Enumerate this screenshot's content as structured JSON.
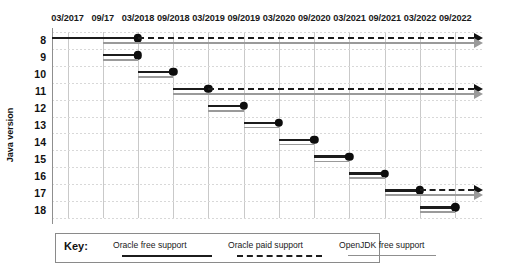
{
  "chart_data": {
    "type": "bar",
    "title": "",
    "subtitle": "",
    "xlabel": "",
    "ylabel": "Java version",
    "grid": true,
    "legend_position": "bottom",
    "x_ticks": [
      "03/2017",
      "09/17",
      "03/2018",
      "09/2018",
      "03/2019",
      "09/2019",
      "03/2020",
      "09/2020",
      "03/2021",
      "09/2021",
      "03/2022",
      "09/2022"
    ],
    "x_tick_values": [
      2017.17,
      2017.67,
      2018.17,
      2018.67,
      2019.17,
      2019.67,
      2020.17,
      2020.67,
      2021.17,
      2021.67,
      2022.17,
      2022.67
    ],
    "xlim": [
      2016.95,
      2023.05
    ],
    "categories": [
      "8",
      "9",
      "10",
      "11",
      "12",
      "13",
      "14",
      "15",
      "16",
      "17",
      "18"
    ],
    "ylim_categories": [
      "8",
      "9",
      "10",
      "11",
      "12",
      "13",
      "14",
      "15",
      "16",
      "17",
      "18"
    ],
    "series": [
      {
        "name": "Oracle free support",
        "style": "solid",
        "color": "#1c1c1c",
        "segments": [
          {
            "version": "8",
            "start": 2016.95,
            "end": 2018.17,
            "end_marker": "dot"
          },
          {
            "version": "9",
            "start": 2017.67,
            "end": 2018.17,
            "end_marker": "dot"
          },
          {
            "version": "10",
            "start": 2018.17,
            "end": 2018.67,
            "end_marker": "dot"
          },
          {
            "version": "11",
            "start": 2018.67,
            "end": 2019.17,
            "end_marker": "dot"
          },
          {
            "version": "12",
            "start": 2019.17,
            "end": 2019.67,
            "end_marker": "dot"
          },
          {
            "version": "13",
            "start": 2019.67,
            "end": 2020.17,
            "end_marker": "dot"
          },
          {
            "version": "14",
            "start": 2020.17,
            "end": 2020.67,
            "end_marker": "dot"
          },
          {
            "version": "15",
            "start": 2020.67,
            "end": 2021.17,
            "end_marker": "dot"
          },
          {
            "version": "16",
            "start": 2021.17,
            "end": 2021.67,
            "end_marker": "dot"
          },
          {
            "version": "17",
            "start": 2021.67,
            "end": 2022.17,
            "end_marker": "dot"
          },
          {
            "version": "18",
            "start": 2022.17,
            "end": 2022.67,
            "end_marker": "dot"
          }
        ]
      },
      {
        "name": "Oracle paid support",
        "style": "dashed",
        "color": "#1c1c1c",
        "segments": [
          {
            "version": "8",
            "start": 2018.17,
            "end": 2023.05,
            "end_marker": "arrow"
          },
          {
            "version": "11",
            "start": 2019.17,
            "end": 2023.05,
            "end_marker": "arrow"
          },
          {
            "version": "17",
            "start": 2022.17,
            "end": 2023.05,
            "end_marker": "arrow"
          }
        ]
      },
      {
        "name": "OpenJDK free support",
        "style": "solid",
        "color": "#9a9a9a",
        "segments": [
          {
            "version": "8",
            "start": 2017.67,
            "end": 2023.05,
            "end_marker": "arrow"
          },
          {
            "version": "9",
            "start": 2017.67,
            "end": 2018.17,
            "end_marker": "none"
          },
          {
            "version": "10",
            "start": 2018.17,
            "end": 2018.67,
            "end_marker": "none"
          },
          {
            "version": "11",
            "start": 2018.67,
            "end": 2023.05,
            "end_marker": "arrow"
          },
          {
            "version": "12",
            "start": 2019.17,
            "end": 2019.67,
            "end_marker": "none"
          },
          {
            "version": "13",
            "start": 2019.67,
            "end": 2020.17,
            "end_marker": "none"
          },
          {
            "version": "14",
            "start": 2020.17,
            "end": 2020.67,
            "end_marker": "none"
          },
          {
            "version": "15",
            "start": 2020.67,
            "end": 2021.17,
            "end_marker": "none"
          },
          {
            "version": "16",
            "start": 2021.17,
            "end": 2021.67,
            "end_marker": "none"
          },
          {
            "version": "17",
            "start": 2021.67,
            "end": 2023.05,
            "end_marker": "arrow"
          },
          {
            "version": "18",
            "start": 2022.17,
            "end": 2022.67,
            "end_marker": "none"
          }
        ]
      }
    ]
  },
  "legend": {
    "key_label": "Key:",
    "items": [
      {
        "label": "Oracle free support",
        "swatch": "solid-dark"
      },
      {
        "label": "Oracle paid support",
        "swatch": "dashed-dark"
      },
      {
        "label": "OpenJDK free support",
        "swatch": "solid-gray"
      }
    ]
  },
  "colors": {
    "oracle_free": "#1c1c1c",
    "oracle_paid": "#1c1c1c",
    "openjdk_free": "#9a9a9a",
    "grid": "#d8d8d8",
    "axis": "#8f8f8f",
    "background": "#ffffff"
  }
}
